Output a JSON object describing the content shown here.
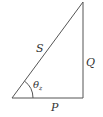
{
  "diagram": {
    "type": "right-triangle",
    "colors": {
      "stroke": "#555555",
      "text": "#333333",
      "background": "#ffffff"
    },
    "vertices": {
      "bottom_left": [
        12,
        98
      ],
      "bottom_right": [
        83,
        98
      ],
      "top": [
        83,
        2
      ]
    },
    "labels": {
      "hypotenuse": "S",
      "vertical_side": "Q",
      "horizontal_side": "P",
      "angle_symbol": "θ",
      "angle_subscript": "z"
    }
  }
}
